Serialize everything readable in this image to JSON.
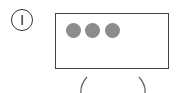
{
  "diagram": {
    "step_label": "I",
    "screen": {
      "dots": [
        {
          "name": "dot-1",
          "color": "#8c8c8c"
        },
        {
          "name": "dot-2",
          "color": "#8c8c8c"
        },
        {
          "name": "dot-3",
          "color": "#8c8c8c"
        }
      ],
      "border_color": "#444444"
    },
    "stand_arcs": [
      "left-arc",
      "right-arc"
    ]
  }
}
